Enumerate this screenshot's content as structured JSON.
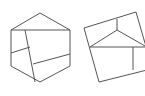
{
  "figure": {
    "stroke_color": "#555555",
    "stroke_width": 1,
    "background": "#ffffff"
  },
  "shapes": [
    {
      "name": "dissected-hexagon",
      "outline": "40,13 70,30 70,66 40,82 11,66 11,30",
      "cuts": [
        "11,30 70,30",
        "25,30 35,82",
        "11,53 30,47",
        "33,64 70,54"
      ]
    },
    {
      "name": "dissected-rotated-square",
      "outline": "84,28 136,12 147,50 147,70 99,82",
      "cuts": [
        "117,19 117,30",
        "90,47 117,30 145,46",
        "90,47 145,47",
        "133,47 133,70"
      ]
    }
  ]
}
